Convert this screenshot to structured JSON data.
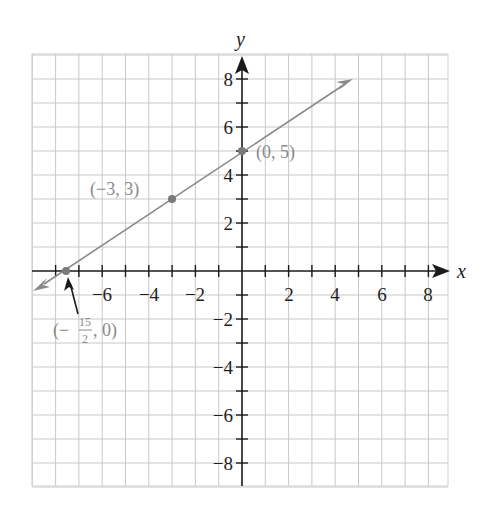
{
  "chart_data": {
    "type": "line",
    "title": "",
    "xlabel": "x",
    "ylabel": "y",
    "xlim": [
      -9,
      9
    ],
    "ylim": [
      -9,
      9
    ],
    "grid": true,
    "x_ticks": [
      -6,
      -4,
      -2,
      2,
      4,
      6,
      8
    ],
    "y_ticks": [
      8,
      6,
      4,
      2,
      -2,
      -4,
      -6,
      -8
    ],
    "x_tick_labels": [
      "−6",
      "−4",
      "−2",
      "2",
      "4",
      "6",
      "8"
    ],
    "y_tick_labels": [
      "8",
      "6",
      "4",
      "2",
      "−2",
      "−4",
      "−6",
      "−8"
    ],
    "series": [
      {
        "name": "line through (-15/2, 0), (-3, 3), (0, 5)",
        "slope": 0.6667,
        "intercept": 5,
        "x": [
          -9,
          5
        ],
        "y": [
          -1,
          8.333
        ],
        "color": "#8a8a8a",
        "arrows": "both"
      }
    ],
    "points": [
      {
        "x": -3,
        "y": 3,
        "label": "(−3, 3)"
      },
      {
        "x": 0,
        "y": 5,
        "label": "(0, 5)"
      },
      {
        "x": -7.5,
        "y": 0,
        "label_prefix": "(−",
        "label_num": "15",
        "label_den": "2",
        "label_suffix": ", 0)"
      }
    ]
  },
  "axes": {
    "x_label": "x",
    "y_label": "y"
  },
  "labels": {
    "pt_a": "(−3, 3)",
    "pt_b": "(0, 5)",
    "pt_c_prefix": "(−",
    "pt_c_num": "15",
    "pt_c_den": "2",
    "pt_c_suffix": ", 0)"
  },
  "ticks": {
    "x": [
      "−6",
      "−4",
      "−2",
      "2",
      "4",
      "6",
      "8"
    ],
    "y": [
      "8",
      "6",
      "4",
      "2",
      "−2",
      "−4",
      "−6",
      "−8"
    ]
  }
}
